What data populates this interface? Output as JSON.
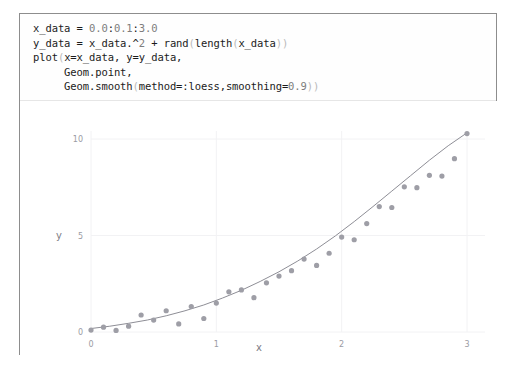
{
  "code": {
    "language": "julia",
    "lines": [
      "x_data = 0.0:0.1:3.0",
      "y_data = x_data.^2 + rand(length(x_data))",
      "plot(x=x_data, y=y_data,",
      "     Geom.point,",
      "     Geom.smooth(method=:loess,smoothing=0.9))"
    ]
  },
  "colors": {
    "frame_border": "#8d8d8d",
    "code_divider": "#e6e6e6",
    "point_fill": "#9e9ea6",
    "curve_stroke": "#8e8e96",
    "gridline": "#f2f2f4",
    "tick_text": "#9b9ba3",
    "axis_text": "#7e7e86",
    "plot_background": "#ffffff"
  },
  "chart_data": {
    "type": "scatter",
    "title": "",
    "xlabel": "x",
    "ylabel": "y",
    "xlim": [
      0,
      3
    ],
    "ylim": [
      0,
      10.5
    ],
    "xticks": [
      0,
      1,
      2,
      3
    ],
    "xtick_labels": [
      "0",
      "1",
      "2",
      "3"
    ],
    "yticks": [
      0,
      5,
      10
    ],
    "ytick_labels": [
      "0",
      "5",
      "10"
    ],
    "grid": true,
    "legend": "none",
    "series": [
      {
        "name": "y_data",
        "kind": "points",
        "marker": "circle",
        "x": [
          0.0,
          0.1,
          0.2,
          0.3,
          0.4,
          0.5,
          0.6,
          0.7,
          0.8,
          0.9,
          1.0,
          1.1,
          1.2,
          1.3,
          1.4,
          1.5,
          1.6,
          1.7,
          1.8,
          1.9,
          2.0,
          2.1,
          2.2,
          2.3,
          2.4,
          2.5,
          2.6,
          2.7,
          2.8,
          2.9,
          3.0
        ],
        "y": [
          0.1,
          0.25,
          0.08,
          0.3,
          0.88,
          0.62,
          1.1,
          0.42,
          1.32,
          0.7,
          1.5,
          2.08,
          2.18,
          1.78,
          2.55,
          2.9,
          3.18,
          3.78,
          3.45,
          4.08,
          4.92,
          4.78,
          5.62,
          6.5,
          6.45,
          7.52,
          7.48,
          8.12,
          8.08,
          8.98,
          10.28
        ]
      },
      {
        "name": "Geom.smooth (loess, smoothing=0.9)",
        "kind": "line",
        "x": [
          0.0,
          0.15,
          0.3,
          0.45,
          0.6,
          0.75,
          0.9,
          1.05,
          1.2,
          1.35,
          1.5,
          1.65,
          1.8,
          1.95,
          2.1,
          2.25,
          2.4,
          2.55,
          2.7,
          2.85,
          3.0
        ],
        "y": [
          0.18,
          0.3,
          0.45,
          0.62,
          0.84,
          1.1,
          1.4,
          1.76,
          2.16,
          2.62,
          3.12,
          3.68,
          4.3,
          4.98,
          5.72,
          6.5,
          7.3,
          8.1,
          8.9,
          9.65,
          10.32
        ]
      }
    ]
  }
}
